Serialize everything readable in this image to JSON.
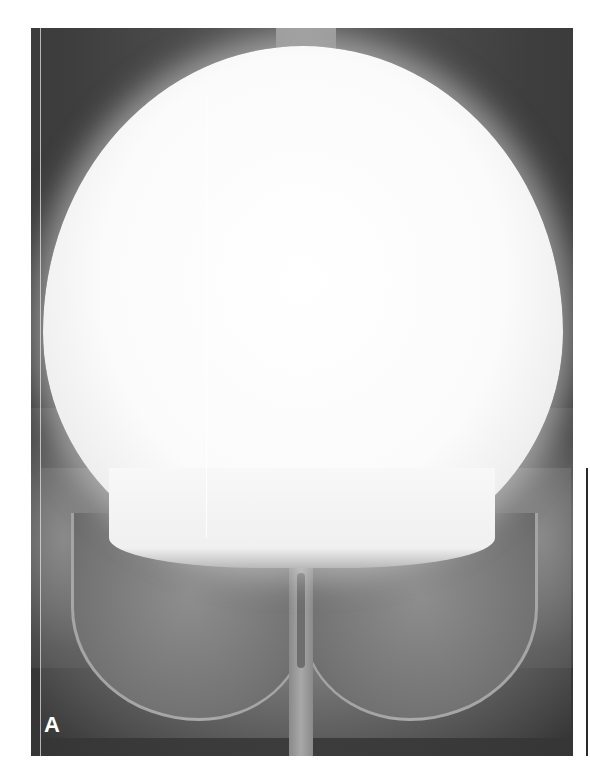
{
  "figure": {
    "panel_label": "A",
    "colors": {
      "background": "#ffffff",
      "film_dark": "#3e3e3e",
      "mass": "#fbfbfb",
      "bone": "#8e8e8e",
      "label": "#ffffff"
    }
  }
}
